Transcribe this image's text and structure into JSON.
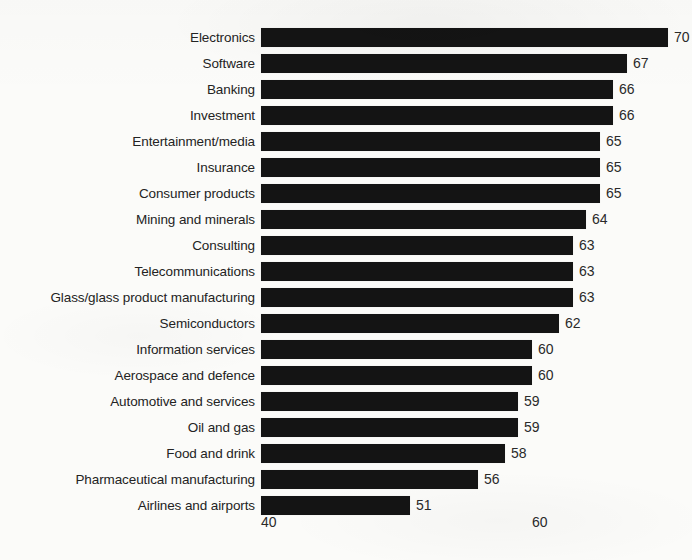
{
  "chart_data": {
    "type": "bar",
    "orientation": "horizontal",
    "title": "",
    "subtitle": "",
    "xlabel": "",
    "ylabel": "",
    "xlim": [
      40,
      71
    ],
    "grid": false,
    "legend": null,
    "xticks": [
      "40",
      "60"
    ],
    "xtick_values": [
      40,
      60
    ],
    "categories": [
      "Electronics",
      "Software",
      "Banking",
      "Investment",
      "Entertainment/media",
      "Insurance",
      "Consumer products",
      "Mining and minerals",
      "Consulting",
      "Telecommunications",
      "Glass/glass product manufacturing",
      "Semiconductors",
      "Information services",
      "Aerospace and defence",
      "Automotive and services",
      "Oil and gas",
      "Food and drink",
      "Pharmaceutical manufacturing",
      "Airlines and airports"
    ],
    "values": [
      70,
      67,
      66,
      66,
      65,
      65,
      65,
      64,
      63,
      63,
      63,
      62,
      60,
      60,
      59,
      59,
      58,
      56,
      51
    ],
    "bar_color": "#141414",
    "background_color": "#fbfbf9",
    "text_color": "#232323"
  }
}
